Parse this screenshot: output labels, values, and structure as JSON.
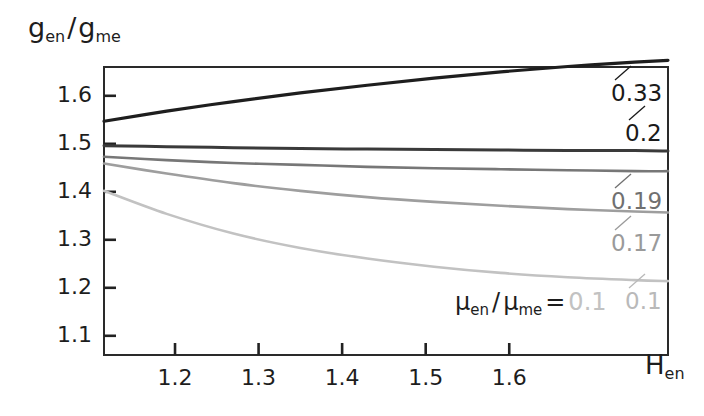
{
  "chart_data": {
    "type": "line",
    "title": "",
    "ylabel": "g_en / g_me",
    "ylabel_parts": {
      "base1": "g",
      "sub1": "en",
      "sep": "/",
      "base2": "g",
      "sub2": "me"
    },
    "xlabel": "H_en",
    "xlabel_parts": {
      "base": "H",
      "sub": "en"
    },
    "xlim": [
      1.115,
      1.79
    ],
    "ylim": [
      1.06,
      1.66
    ],
    "xticks": [
      1.2,
      1.3,
      1.4,
      1.5,
      1.6
    ],
    "xtick_labels": [
      "1.2",
      "1.3",
      "1.4",
      "1.5",
      "1.6"
    ],
    "yticks": [
      1.1,
      1.2,
      1.3,
      1.4,
      1.5,
      1.6
    ],
    "ytick_labels": [
      "1.1",
      "1.2",
      "1.3",
      "1.4",
      "1.5",
      "1.6"
    ],
    "grid": false,
    "frame": true,
    "legend_position": "inside-bottom-right",
    "legend_prefix": "μ_en / μ_me =",
    "legend_prefix_parts": {
      "base1": "μ",
      "sub1": "en",
      "sep": "/",
      "base2": "μ",
      "sub2": "me",
      "eq": "="
    },
    "legend_value": "0.1",
    "series": [
      {
        "name": "0.33",
        "label": "0.33",
        "color": "#1e1e1e",
        "width": 3.2,
        "x": [
          1.115,
          1.19,
          1.27,
          1.35,
          1.43,
          1.51,
          1.59,
          1.67,
          1.75,
          1.79
        ],
        "values": [
          1.547,
          1.568,
          1.588,
          1.606,
          1.622,
          1.637,
          1.65,
          1.661,
          1.67,
          1.674
        ]
      },
      {
        "name": "0.2",
        "label": "0.2",
        "color": "#3a3a3a",
        "width": 3.0,
        "x": [
          1.115,
          1.19,
          1.27,
          1.35,
          1.43,
          1.51,
          1.59,
          1.67,
          1.75,
          1.79
        ],
        "values": [
          1.496,
          1.494,
          1.492,
          1.49,
          1.489,
          1.488,
          1.487,
          1.486,
          1.486,
          1.485
        ]
      },
      {
        "name": "0.19",
        "label": "0.19",
        "color": "#777777",
        "width": 2.6,
        "x": [
          1.115,
          1.19,
          1.27,
          1.35,
          1.43,
          1.51,
          1.59,
          1.67,
          1.75,
          1.79
        ],
        "values": [
          1.473,
          1.466,
          1.46,
          1.456,
          1.452,
          1.449,
          1.447,
          1.445,
          1.443,
          1.443
        ]
      },
      {
        "name": "0.17",
        "label": "0.17",
        "color": "#9e9e9e",
        "width": 2.6,
        "x": [
          1.115,
          1.19,
          1.27,
          1.35,
          1.43,
          1.51,
          1.59,
          1.67,
          1.75,
          1.79
        ],
        "values": [
          1.459,
          1.438,
          1.418,
          1.402,
          1.389,
          1.379,
          1.371,
          1.364,
          1.359,
          1.357
        ]
      },
      {
        "name": "0.1",
        "label": "0.1",
        "color": "#c2c2c2",
        "width": 2.6,
        "x": [
          1.115,
          1.19,
          1.27,
          1.35,
          1.43,
          1.51,
          1.59,
          1.67,
          1.75,
          1.79
        ],
        "values": [
          1.402,
          1.354,
          1.313,
          1.283,
          1.261,
          1.244,
          1.231,
          1.222,
          1.216,
          1.214
        ]
      }
    ],
    "annotations": [
      {
        "text": "0.33",
        "color": "#1a1a1a",
        "x_px": 611,
        "y_px": 82
      },
      {
        "text": "0.2",
        "color": "#1a1a1a",
        "x_px": 625,
        "y_px": 122
      },
      {
        "text": "0.19",
        "color": "#707070",
        "x_px": 611,
        "y_px": 190
      },
      {
        "text": "0.17",
        "color": "#9a9a9a",
        "x_px": 611,
        "y_px": 232
      },
      {
        "text": "0.1",
        "color": "#b9b9b9",
        "x_px": 625,
        "y_px": 290
      }
    ]
  }
}
